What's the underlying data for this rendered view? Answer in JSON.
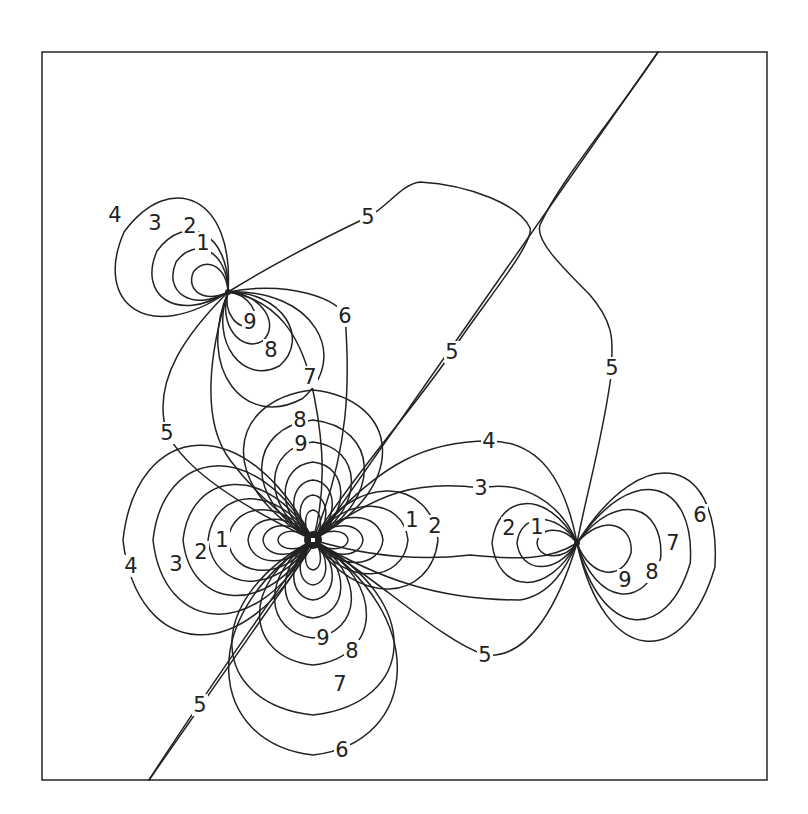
{
  "figure": {
    "type": "contour-map",
    "frame": {
      "x": 42,
      "y": 52,
      "width": 725,
      "height": 728
    },
    "colors": {
      "line": "#222222",
      "background": "#ffffff"
    },
    "nodal_line": {
      "x1": 658,
      "y1": 52,
      "x2": 149,
      "y2": 780
    },
    "centers": [
      {
        "name": "upper-left-node",
        "x": 228,
        "y": 292
      },
      {
        "name": "central-node",
        "x": 313,
        "y": 540
      },
      {
        "name": "right-node",
        "x": 577,
        "y": 543
      }
    ],
    "contour_levels": [
      1,
      2,
      3,
      4,
      5,
      6,
      7,
      8,
      9
    ],
    "labels": [
      {
        "text": "4",
        "x": 115,
        "y": 215
      },
      {
        "text": "3",
        "x": 155,
        "y": 223
      },
      {
        "text": "2",
        "x": 190,
        "y": 226
      },
      {
        "text": "1",
        "x": 203,
        "y": 243
      },
      {
        "text": "9",
        "x": 250,
        "y": 322
      },
      {
        "text": "8",
        "x": 271,
        "y": 350
      },
      {
        "text": "6",
        "x": 345,
        "y": 316
      },
      {
        "text": "7",
        "x": 310,
        "y": 377
      },
      {
        "text": "5",
        "x": 368,
        "y": 217
      },
      {
        "text": "5",
        "x": 452,
        "y": 352
      },
      {
        "text": "5",
        "x": 612,
        "y": 368
      },
      {
        "text": "5",
        "x": 167,
        "y": 433
      },
      {
        "text": "8",
        "x": 300,
        "y": 420
      },
      {
        "text": "9",
        "x": 301,
        "y": 444
      },
      {
        "text": "1",
        "x": 412,
        "y": 520
      },
      {
        "text": "2",
        "x": 435,
        "y": 526
      },
      {
        "text": "4",
        "x": 131,
        "y": 566
      },
      {
        "text": "3",
        "x": 176,
        "y": 564
      },
      {
        "text": "2",
        "x": 201,
        "y": 552
      },
      {
        "text": "1",
        "x": 222,
        "y": 540
      },
      {
        "text": "9",
        "x": 323,
        "y": 638
      },
      {
        "text": "8",
        "x": 352,
        "y": 651
      },
      {
        "text": "7",
        "x": 340,
        "y": 684
      },
      {
        "text": "6",
        "x": 342,
        "y": 750
      },
      {
        "text": "5",
        "x": 200,
        "y": 705
      },
      {
        "text": "5",
        "x": 485,
        "y": 655
      },
      {
        "text": "4",
        "x": 489,
        "y": 441
      },
      {
        "text": "3",
        "x": 481,
        "y": 488
      },
      {
        "text": "2",
        "x": 509,
        "y": 528
      },
      {
        "text": "1",
        "x": 537,
        "y": 527
      },
      {
        "text": "6",
        "x": 700,
        "y": 515
      },
      {
        "text": "7",
        "x": 673,
        "y": 543
      },
      {
        "text": "8",
        "x": 652,
        "y": 572
      },
      {
        "text": "9",
        "x": 625,
        "y": 580
      }
    ],
    "lobes": [
      {
        "cx": 228,
        "cy": 292,
        "angle": -150,
        "lens": [
          40,
          60,
          82,
          120
        ],
        "wids": [
          0.55,
          0.6,
          0.65,
          0.72
        ]
      },
      {
        "cx": 228,
        "cy": 292,
        "angle": 55,
        "lens": [
          40,
          60,
          90,
          130
        ],
        "wids": [
          0.4,
          0.45,
          0.5,
          0.55
        ]
      },
      {
        "cx": 313,
        "cy": 540,
        "angle": -90,
        "lens": [
          30,
          45,
          60,
          78,
          98,
          120,
          150
        ],
        "wids": [
          0.35,
          0.4,
          0.45,
          0.5,
          0.55,
          0.6,
          0.65
        ]
      },
      {
        "cx": 313,
        "cy": 540,
        "angle": 90,
        "lens": [
          30,
          45,
          60,
          78,
          98,
          125,
          175,
          215
        ],
        "wids": [
          0.35,
          0.4,
          0.45,
          0.5,
          0.55,
          0.6,
          0.65,
          0.55
        ]
      },
      {
        "cx": 313,
        "cy": 540,
        "angle": 180,
        "lens": [
          35,
          50,
          65,
          85,
          105,
          130,
          160,
          190
        ],
        "wids": [
          0.35,
          0.4,
          0.45,
          0.5,
          0.55,
          0.6,
          0.65,
          0.7
        ]
      },
      {
        "cx": 313,
        "cy": 540,
        "angle": 0,
        "lens": [
          35,
          50,
          70,
          95,
          125
        ],
        "wids": [
          0.35,
          0.4,
          0.45,
          0.5,
          0.55
        ]
      },
      {
        "cx": 577,
        "cy": 543,
        "angle": 180,
        "lens": [
          40,
          60,
          85
        ],
        "wids": [
          0.45,
          0.55,
          0.65
        ]
      },
      {
        "cx": 577,
        "cy": 543,
        "angle": 10,
        "lens": [
          55,
          85,
          115,
          140
        ],
        "wids": [
          0.6,
          0.7,
          0.8,
          0.85
        ]
      }
    ],
    "open_curves": [
      "M 228 292 C 280 260, 330 235, 368 217 C 390 205, 400 185, 420 182 C 470 185, 520 205, 530 228 C 535 245, 470 320, 452 352 C 420 400, 350 480, 313 540",
      "M 658 52 C 620 110, 560 180, 540 225 C 535 240, 560 265, 590 295 C 620 330, 610 350, 612 368 C 605 430, 585 500, 577 543",
      "M 228 292 C 190 330, 150 380, 167 433 C 190 480, 270 520, 313 540",
      "M 313 540 C 250 630, 200 700, 149 780",
      "M 313 540 C 380 580, 440 640, 485 655 C 530 660, 560 600, 577 543",
      "M 313 540 C 380 580, 440 600, 520 600 C 550 595, 565 570, 577 543",
      "M 313 540 C 380 560, 430 560, 470 555 C 520 560, 550 560, 577 543",
      "M 313 540 C 380 460, 430 441, 489 441 C 540 441, 565 480, 577 543",
      "M 313 540 C 380 490, 420 480, 481 488 C 520 480, 560 500, 577 543",
      "M 228 292 C 290 280, 340 300, 345 316 C 350 380, 350 450, 313 540",
      "M 228 292 C 280 300, 300 340, 310 377 C 320 420, 330 480, 313 540",
      "M 228 292 C 210 350, 200 420, 230 460 C 260 500, 290 520, 313 540"
    ]
  }
}
